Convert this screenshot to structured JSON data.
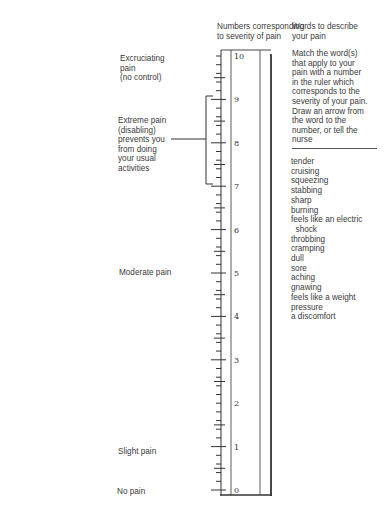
{
  "headers": {
    "scale": "Numbers corresponding\nto severity of pain",
    "words": "Words to describe\nyour pain"
  },
  "instructions": "Match the word(s)\nthat apply to your\npain with a number\nin the ruler which\ncorresponds to the\nseverity of your pain.\nDraw an arrow from\nthe word to the\nnumber, or tell the\nnurse",
  "severity_labels": {
    "excruciating": "Excruciating\npain\n(no control)",
    "extreme": "Extreme pain\n(disabling)\nprevents you\nfrom doing\nyour usual\nactivities",
    "moderate": "Moderate pain",
    "slight": "Slight pain",
    "none": "No pain"
  },
  "ruler": {
    "numbers": [
      "10",
      "9",
      "8",
      "7",
      "6",
      "5",
      "4",
      "3",
      "2",
      "1",
      "0"
    ],
    "min": 0,
    "max": 10,
    "subdivisions": 5
  },
  "pain_words": [
    "tender",
    "cruising",
    "squeezing",
    "stabbing",
    "sharp",
    "burning",
    "feels like an electric",
    "  shock",
    "throbbing",
    "cramping",
    "dull",
    "sore",
    "aching",
    "gnawing",
    "feels like a weight",
    "pressure",
    "a discomfort"
  ]
}
